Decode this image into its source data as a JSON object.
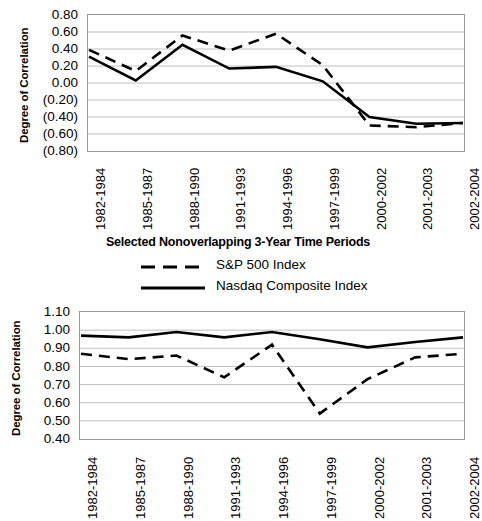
{
  "chart_data": [
    {
      "id": "top-chart",
      "type": "line",
      "title": "",
      "xlabel": "Selected Nonoverlapping 3-Year Time Periods",
      "ylabel": "Degree of Correlation",
      "categories": [
        "1982-1984",
        "1985-1987",
        "1988-1990",
        "1991-1993",
        "1994-1996",
        "1997-1999",
        "2000-2002",
        "2001-2003",
        "2002-2004"
      ],
      "ylim": [
        -0.8,
        0.8
      ],
      "yticks": [
        0.8,
        0.6,
        0.4,
        0.2,
        0.0,
        -0.2,
        -0.4,
        -0.6,
        -0.8
      ],
      "ytick_labels": [
        "0.80",
        "0.60",
        "0.40",
        "0.20",
        "0.00",
        "(0.20)",
        "(0.40)",
        "(0.60)",
        "(0.80)"
      ],
      "grid": true,
      "legend_position": "below",
      "series": [
        {
          "name": "S&P 500 Index",
          "style": "dashed",
          "color": "#000000",
          "values": [
            0.39,
            0.14,
            0.56,
            0.38,
            0.58,
            0.21,
            -0.5,
            -0.52,
            -0.47
          ]
        },
        {
          "name": "Nasdaq Composite Index",
          "style": "solid",
          "color": "#000000",
          "values": [
            0.31,
            0.03,
            0.45,
            0.17,
            0.19,
            0.02,
            -0.4,
            -0.48,
            -0.47
          ]
        }
      ]
    },
    {
      "id": "bottom-chart",
      "type": "line",
      "title": "",
      "xlabel": "",
      "ylabel": "Degree of Correlation",
      "categories": [
        "1982-1984",
        "1985-1987",
        "1988-1990",
        "1991-1993",
        "1994-1996",
        "1997-1999",
        "2000-2002",
        "2001-2003",
        "2002-2004"
      ],
      "ylim": [
        0.4,
        1.1
      ],
      "yticks": [
        1.1,
        1.0,
        0.9,
        0.8,
        0.7,
        0.6,
        0.5,
        0.4
      ],
      "ytick_labels": [
        "1.10",
        "1.00",
        "0.90",
        "0.80",
        "0.70",
        "0.60",
        "0.50",
        "0.40"
      ],
      "grid": true,
      "legend_position": "none",
      "series": [
        {
          "name": "S&P 500 Index",
          "style": "dashed",
          "color": "#000000",
          "values": [
            0.87,
            0.84,
            0.86,
            0.74,
            0.92,
            0.54,
            0.73,
            0.85,
            0.87
          ]
        },
        {
          "name": "Nasdaq Composite Index",
          "style": "solid",
          "color": "#000000",
          "values": [
            0.97,
            0.96,
            0.99,
            0.96,
            0.99,
            0.95,
            0.905,
            0.935,
            0.96
          ]
        }
      ]
    }
  ],
  "top": {
    "ylabel": "Degree of Correlation",
    "ytick_labels": [
      "0.80",
      "0.60",
      "0.40",
      "0.20",
      "0.00",
      "(0.20)",
      "(0.40)",
      "(0.60)",
      "(0.80)"
    ],
    "xtick_labels": [
      "1982-1984",
      "1985-1987",
      "1988-1990",
      "1991-1993",
      "1994-1996",
      "1997-1999",
      "2000-2002",
      "2001-2003",
      "2002-2004"
    ],
    "xlabel": "Selected Nonoverlapping 3-Year Time Periods",
    "legend": [
      {
        "label": "S&P 500 Index",
        "style": "dashed"
      },
      {
        "label": "Nasdaq Composite Index",
        "style": "solid"
      }
    ]
  },
  "bottom": {
    "ylabel": "Degree of Correlation",
    "ytick_labels": [
      "1.10",
      "1.00",
      "0.90",
      "0.80",
      "0.70",
      "0.60",
      "0.50",
      "0.40"
    ],
    "xtick_labels": [
      "1982-1984",
      "1985-1987",
      "1988-1990",
      "1991-1993",
      "1994-1996",
      "1997-1999",
      "2000-2002",
      "2001-2003",
      "2002-2004"
    ]
  },
  "colors": {
    "line": "#000000",
    "grid": "#bfbfbf",
    "frame": "#9a9a9a",
    "background": "#ffffff"
  }
}
